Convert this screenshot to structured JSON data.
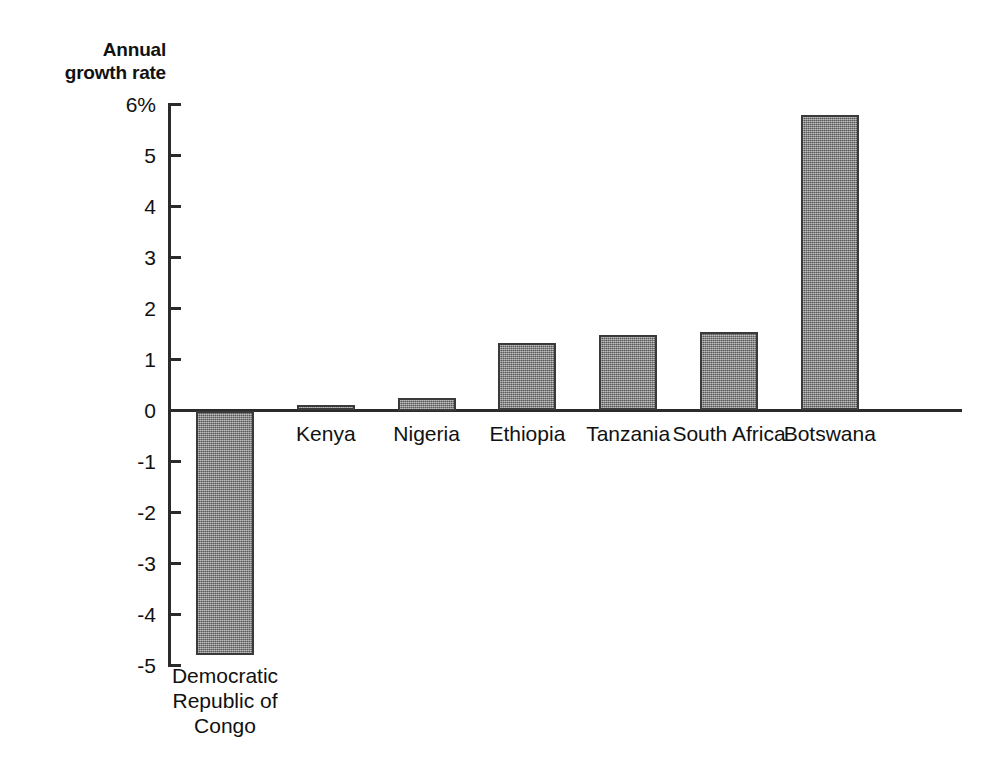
{
  "chart_data": {
    "type": "bar",
    "title": "",
    "axis_title_lines": [
      "Annual",
      "growth rate"
    ],
    "ylabel": "Annual growth rate",
    "xlabel": "",
    "categories": [
      "Democratic Republic of Congo",
      "Kenya",
      "Nigeria",
      "Ethiopia",
      "Tanzania",
      "South Africa",
      "Botswana"
    ],
    "category_label_lines": [
      [
        "Democratic",
        "Republic of",
        "Congo"
      ],
      [
        "Kenya"
      ],
      [
        "Nigeria"
      ],
      [
        "Ethiopia"
      ],
      [
        "Tanzania"
      ],
      [
        "South Africa"
      ],
      [
        "Botswana"
      ]
    ],
    "values": [
      -4.8,
      0.1,
      0.25,
      1.32,
      1.48,
      1.53,
      5.8
    ],
    "ylim": [
      -5,
      6
    ],
    "ytick_values": [
      6,
      5,
      4,
      3,
      2,
      1,
      0,
      -1,
      -2,
      -3,
      -4,
      -5
    ],
    "ytick_labels": [
      "6%",
      "5",
      "4",
      "3",
      "2",
      "1",
      "0",
      "-1",
      "-2",
      "-3",
      "-4",
      "-5"
    ],
    "grid": false,
    "legend": null,
    "bar_color": "#7d7d7d",
    "bar_edge_color": "#3a3a3a",
    "axis_color": "#2b2b2b",
    "background_color": "#ffffff"
  },
  "caption": {
    "sliver_text": ""
  }
}
